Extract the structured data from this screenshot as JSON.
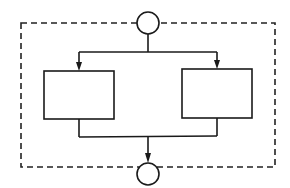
{
  "diagram": {
    "type": "flowchart",
    "colors": {
      "line": "#1a1a1a",
      "background": "#ffffff"
    },
    "boundary": {
      "style": "dashed",
      "x1": 21,
      "y1": 23,
      "x2": 275,
      "y2": 167
    },
    "nodes": [
      {
        "id": "start",
        "shape": "circle",
        "cx": 148,
        "cy": 23,
        "r": 11,
        "label": ""
      },
      {
        "id": "process-left",
        "shape": "rectangle",
        "x": 44,
        "y": 71,
        "w": 70,
        "h": 48,
        "label": ""
      },
      {
        "id": "process-right",
        "shape": "rectangle",
        "x": 182,
        "y": 69,
        "w": 70,
        "h": 49,
        "label": ""
      },
      {
        "id": "end",
        "shape": "circle",
        "cx": 148,
        "cy": 174,
        "r": 11,
        "label": ""
      }
    ],
    "edges": [
      {
        "from": "start",
        "to": "process-left",
        "arrow": true
      },
      {
        "from": "start",
        "to": "process-right",
        "arrow": true
      },
      {
        "from": "process-left",
        "to": "end",
        "arrow": true
      },
      {
        "from": "process-right",
        "to": "end",
        "arrow": true
      }
    ]
  }
}
